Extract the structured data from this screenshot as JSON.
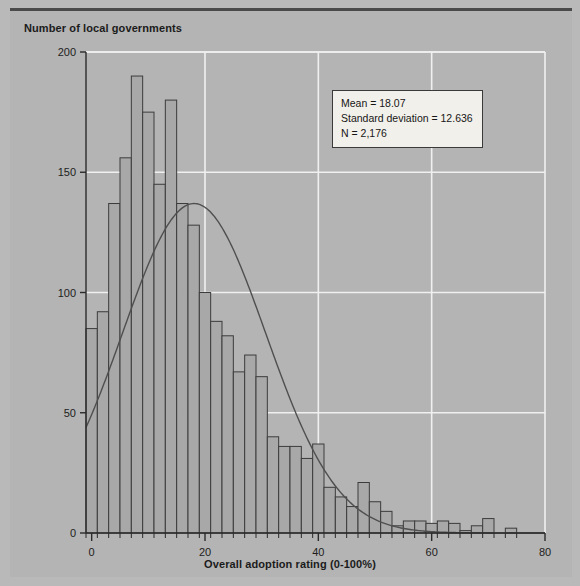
{
  "figure": {
    "y_axis_title": "Number of local governments",
    "x_axis_title": "Overall adoption rating (0-100%)"
  },
  "stats": {
    "mean_line": "Mean = 18.07",
    "sd_line": "Standard deviation = 12.636",
    "n_line": "N = 2,176"
  },
  "axis_labels": {
    "y": [
      "0",
      "50",
      "100",
      "150",
      "200"
    ],
    "x": [
      "0",
      "20",
      "40",
      "60",
      "80"
    ]
  },
  "colors": {
    "background": "#b9b9b9",
    "plate": "#b4b4b4",
    "bar_fill": "#a8a8a8",
    "bar_stroke": "#3c3c3c",
    "gridline": "#f0f0f0",
    "axis": "#2b2b2b",
    "curve": "#4f4f4f",
    "text": "#1b1b1b",
    "stats_box_fill": "#f2f0ea"
  },
  "chart_data": {
    "type": "bar",
    "title": "",
    "subtitle": "",
    "xlabel": "Overall adoption rating (0-100%)",
    "ylabel": "Number of local governments",
    "xlim": [
      -1,
      80
    ],
    "ylim": [
      0,
      200
    ],
    "yticks": [
      0,
      50,
      100,
      150,
      200
    ],
    "xticks": [
      0,
      20,
      40,
      60,
      80
    ],
    "grid": true,
    "legend": "none",
    "bin_width": 2,
    "bin_starts": [
      -1,
      1,
      3,
      5,
      7,
      9,
      11,
      13,
      15,
      17,
      19,
      21,
      23,
      25,
      27,
      29,
      31,
      33,
      35,
      37,
      39,
      41,
      43,
      45,
      47,
      49,
      51,
      53,
      55,
      57,
      59,
      61,
      63,
      65,
      67,
      69,
      71,
      73,
      75
    ],
    "values": [
      85,
      92,
      137,
      156,
      190,
      175,
      145,
      180,
      137,
      128,
      100,
      88,
      82,
      67,
      74,
      65,
      40,
      36,
      36,
      31,
      37,
      19,
      15,
      11,
      21,
      13,
      9,
      3,
      5,
      5,
      4,
      5,
      4,
      1,
      3,
      6,
      0,
      2,
      0
    ],
    "annotations": [
      "Mean = 18.07",
      "Standard deviation = 12.636",
      "N = 2,176"
    ],
    "overlay_curve": {
      "name": "normal curve",
      "type": "line",
      "mean": 18.07,
      "sd": 12.636,
      "peak_value": 137,
      "n": 2176
    }
  }
}
